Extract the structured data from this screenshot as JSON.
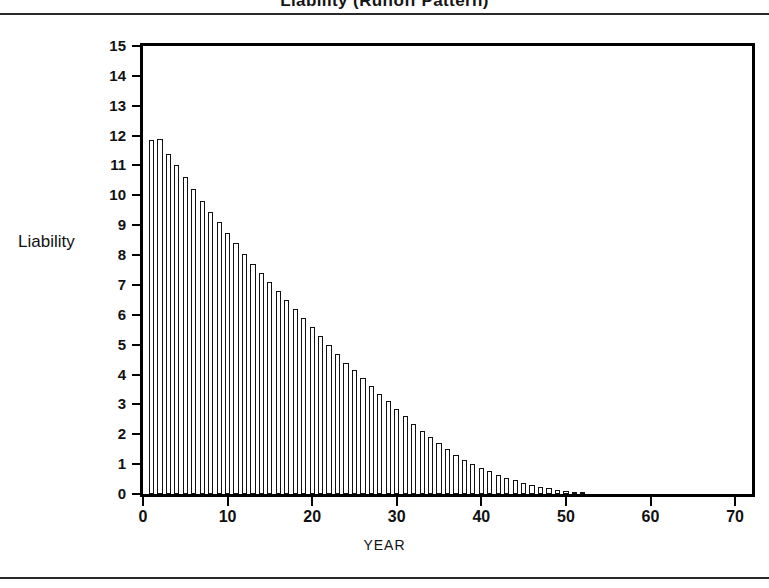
{
  "page": {
    "title_clipped": "Liability (Runoff Pattern)",
    "rule_color": "#2a2a2a"
  },
  "chart_data": {
    "type": "bar",
    "title": "",
    "xlabel": "YEAR",
    "ylabel": "Liability",
    "xlim": [
      0,
      72
    ],
    "ylim": [
      0,
      15
    ],
    "grid": false,
    "legend": null,
    "bar_fill": "#ffffff",
    "bar_edge": "#111111",
    "y_ticks": [
      0,
      1,
      2,
      3,
      4,
      5,
      6,
      7,
      8,
      9,
      10,
      11,
      12,
      13,
      14,
      15
    ],
    "y_tick_labels": [
      "0",
      "1",
      "2",
      "3",
      "4",
      "5",
      "6",
      "7",
      "8",
      "9",
      "10",
      "11",
      "12",
      "13",
      "14",
      "15"
    ],
    "x_ticks": [
      0,
      10,
      20,
      30,
      40,
      50,
      60,
      70
    ],
    "x_tick_labels": [
      "0",
      "10",
      "20",
      "30",
      "40",
      "50",
      "60",
      "70"
    ],
    "categories": [
      1,
      2,
      3,
      4,
      5,
      6,
      7,
      8,
      9,
      10,
      11,
      12,
      13,
      14,
      15,
      16,
      17,
      18,
      19,
      20,
      21,
      22,
      23,
      24,
      25,
      26,
      27,
      28,
      29,
      30,
      31,
      32,
      33,
      34,
      35,
      36,
      37,
      38,
      39,
      40,
      41,
      42,
      43,
      44,
      45,
      46,
      47,
      48,
      49,
      50,
      51,
      52
    ],
    "values": [
      11.85,
      11.9,
      11.4,
      11.0,
      10.6,
      10.2,
      9.8,
      9.45,
      9.1,
      8.75,
      8.4,
      8.05,
      7.7,
      7.4,
      7.1,
      6.8,
      6.5,
      6.2,
      5.9,
      5.6,
      5.3,
      5.0,
      4.7,
      4.4,
      4.15,
      3.9,
      3.6,
      3.35,
      3.1,
      2.85,
      2.6,
      2.35,
      2.1,
      1.9,
      1.7,
      1.5,
      1.32,
      1.15,
      1.0,
      0.88,
      0.76,
      0.65,
      0.55,
      0.46,
      0.38,
      0.31,
      0.25,
      0.2,
      0.15,
      0.11,
      0.07,
      0.04
    ]
  }
}
